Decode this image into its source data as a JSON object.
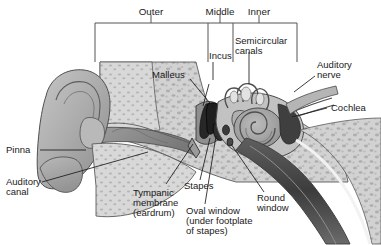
{
  "figure": {
    "style": "grayscale-medical-illustration",
    "width": 381,
    "height": 245
  },
  "colors": {
    "background": "#ffffff",
    "ink": "#1a1a1a",
    "outline": "#4a4a4a",
    "bone_fill": "#c9c9c9",
    "bone_light": "#dcdcdc",
    "cartilage": "#b4b4b4",
    "cartilage_dark": "#8e8e8e",
    "canal_dark": "#6b6b6b",
    "ossicle_dark": "#2b2b2b",
    "cochlea_fill": "#a8a8a8",
    "speckle": "#9a9a9a",
    "bracket": "#555555"
  },
  "regions": {
    "bracket_label": "region-bracket",
    "items": [
      {
        "id": "outer",
        "label": "Outer",
        "x_start": 95,
        "x_end": 208,
        "tick_x": 151,
        "label_x": 151
      },
      {
        "id": "middle",
        "label": "Middle",
        "x_start": 208,
        "x_end": 233,
        "tick_x": 220,
        "label_x": 220
      },
      {
        "id": "inner",
        "label": "Inner",
        "x_start": 233,
        "x_end": 297,
        "tick_x": 259,
        "label_x": 259
      }
    ],
    "bar_y": 23,
    "label_y": 13,
    "drop_y": 62
  },
  "labels": [
    {
      "id": "malleus",
      "text": "Malleus",
      "x": 152,
      "y": 76,
      "anchor": "start",
      "lines": [
        "Malleus"
      ]
    },
    {
      "id": "incus",
      "text": "Incus",
      "x": 211,
      "y": 59,
      "anchor": "start",
      "lines": [
        "Incus"
      ]
    },
    {
      "id": "semicircular-canals",
      "text": "Semicircular canals",
      "x": 235,
      "y": 43,
      "anchor": "start",
      "lines": [
        "Semicircular",
        "canals"
      ]
    },
    {
      "id": "auditory-nerve",
      "text": "Auditory nerve",
      "x": 317,
      "y": 67,
      "anchor": "start",
      "lines": [
        "Auditory",
        "nerve"
      ]
    },
    {
      "id": "cochlea",
      "text": "Cochlea",
      "x": 330,
      "y": 111,
      "anchor": "start",
      "lines": [
        "Cochlea"
      ]
    },
    {
      "id": "pinna",
      "text": "Pinna",
      "x": 6,
      "y": 153,
      "anchor": "start",
      "lines": [
        "Pinna"
      ]
    },
    {
      "id": "auditory-canal",
      "text": "Auditory canal",
      "x": 6,
      "y": 185,
      "anchor": "start",
      "lines": [
        "Auditory",
        "canal"
      ]
    },
    {
      "id": "tympanic-membrane",
      "text": "Tympanic membrane (eardrum)",
      "x": 133,
      "y": 194,
      "anchor": "start",
      "lines": [
        "Tympanic",
        "membrane",
        "(eardrum)"
      ]
    },
    {
      "id": "stapes",
      "text": "Stapes",
      "x": 184,
      "y": 188,
      "anchor": "start",
      "lines": [
        "Stapes"
      ]
    },
    {
      "id": "oval-window",
      "text": "Oval window (under footplate of stapes)",
      "x": 186,
      "y": 213,
      "anchor": "start",
      "lines": [
        "Oval window",
        "(under footplate",
        "of stapes)"
      ]
    },
    {
      "id": "round-window",
      "text": "Round window",
      "x": 256,
      "y": 200,
      "anchor": "start",
      "lines": [
        "Round",
        "window"
      ]
    }
  ],
  "leaders": [
    {
      "id": "leader-malleus",
      "d": "M 190 79 L 214 108"
    },
    {
      "id": "leader-incus",
      "d": "M 213 62 L 213 80 M 207 84 L 202 106"
    },
    {
      "id": "leader-semicircular",
      "d": "M 249 52 L 249 82"
    },
    {
      "id": "leader-auditory-nerve",
      "d": "M 316 78 L 296 92"
    },
    {
      "id": "leader-cochlea",
      "d": "M 327 108 L 294 117"
    },
    {
      "id": "leader-pinna",
      "d": "M 40 150 L 84 150"
    },
    {
      "id": "leader-auditory-canal",
      "d": "M 40 182 L 146 152"
    },
    {
      "id": "leader-tympanic-membrane",
      "d": "M 163 184 L 192 143"
    },
    {
      "id": "leader-stapes",
      "d": "M 199 180 L 208 138"
    },
    {
      "id": "leader-oval-window",
      "d": "M 203 205 L 213 140"
    },
    {
      "id": "leader-round-window",
      "d": "M 262 192 L 230 143"
    }
  ],
  "anatomy": {
    "pinna": "outer ear flap with helix spiral",
    "auditory_canal": "ear canal tube",
    "tympanic_membrane": "eardrum",
    "ossicles": [
      "malleus",
      "incus",
      "stapes"
    ],
    "cochlea": "spiral snail shell organ",
    "semicircular_canals": "three looping balance canals",
    "auditory_nerve": "nerve fiber bundle",
    "oval_window": "membrane under stapes footplate",
    "round_window": "membrane below oval window",
    "temporal_bone": "stippled bone texture"
  }
}
